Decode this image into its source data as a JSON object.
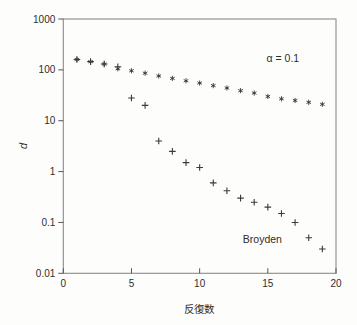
{
  "figure": {
    "background": "#fdfdfc",
    "axis_color": "#8a8a8a",
    "tick_color": "#555555",
    "text_color": "#2e2e2e",
    "marker_color": "#3a3a3a"
  },
  "chart_data": {
    "type": "scatter",
    "title": "",
    "xlabel": "反復数",
    "ylabel": "d",
    "xlim": [
      0,
      20
    ],
    "ylim": [
      0.01,
      1000
    ],
    "y_scale": "log",
    "grid": false,
    "legend_position": "none",
    "x_ticks": [
      "0",
      "5",
      "10",
      "15",
      "20"
    ],
    "x_tick_values": [
      0,
      5,
      10,
      15,
      20
    ],
    "y_ticks": [
      "1000",
      "100",
      "10",
      "1",
      "0.1",
      "0.01"
    ],
    "y_tick_values": [
      1000,
      100,
      10,
      1,
      0.1,
      0.01
    ],
    "x": [
      1,
      2,
      3,
      4,
      5,
      6,
      7,
      8,
      9,
      10,
      11,
      12,
      13,
      14,
      15,
      16,
      17,
      18,
      19
    ],
    "series": [
      {
        "name": "alpha = 0.1",
        "marker": "asterisk",
        "values": [
          160,
          145,
          130,
          105,
          96,
          86,
          76,
          68,
          61,
          55,
          49,
          44,
          39,
          35,
          30,
          27,
          25,
          23,
          21
        ]
      },
      {
        "name": "Broyden",
        "marker": "plus",
        "values": [
          160,
          145,
          130,
          115,
          28,
          20,
          4,
          2.5,
          1.5,
          1.2,
          0.6,
          0.42,
          0.3,
          0.25,
          0.2,
          0.15,
          0.1,
          0.05,
          0.03
        ]
      }
    ],
    "annotations": [
      {
        "text": "α = 0.1",
        "x": 16.1,
        "y": 170
      },
      {
        "text": "Broyden",
        "x": 14.6,
        "y": 0.047
      }
    ]
  }
}
